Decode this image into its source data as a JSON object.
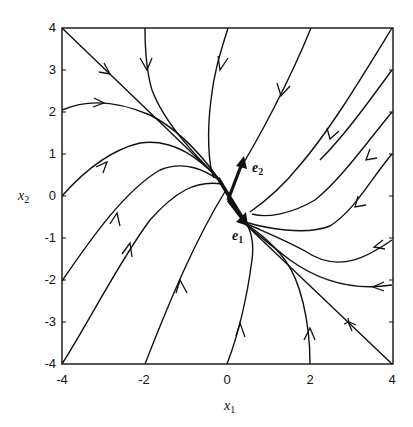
{
  "figure": {
    "type": "phase-portrait",
    "xaxis": {
      "label": "x",
      "label_sub": "1",
      "ticks": [
        "-4",
        "-2",
        "0",
        "2",
        "4"
      ],
      "range": [
        -4,
        4
      ]
    },
    "yaxis": {
      "label": "x",
      "label_sub": "2",
      "ticks": [
        "4",
        "3",
        "2",
        "1",
        "0",
        "-1",
        "-2",
        "-3",
        "-4"
      ],
      "range": [
        -4,
        4
      ]
    },
    "eigenvectors": [
      {
        "label": "e",
        "sub": "1",
        "direction": "along slow manifold (down-right)"
      },
      {
        "label": "e",
        "sub": "2",
        "direction": "up-right"
      }
    ],
    "colors": {
      "line": "#111111",
      "background": "#ffffff"
    }
  }
}
